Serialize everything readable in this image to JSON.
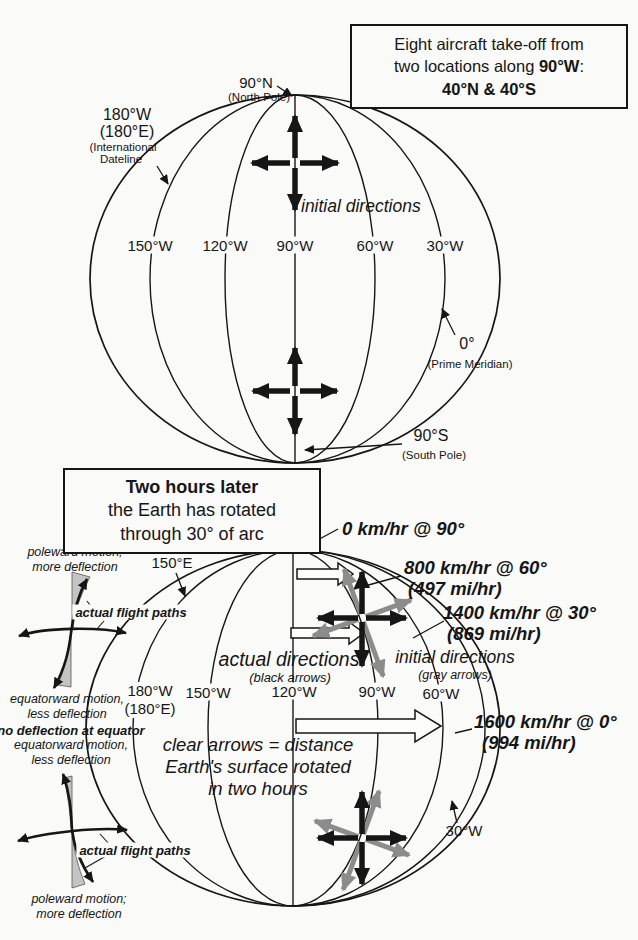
{
  "top": {
    "box": {
      "l1": "Eight aircraft take-off from",
      "l2a": "two locations along ",
      "l2b": "90°W",
      "l2c": ":",
      "l3": "40°N & 40°S"
    },
    "north_pole": {
      "deg": "90°N",
      "name": "(North Pole)"
    },
    "dateline": {
      "deg": "180°W",
      "deg2": "(180°E)",
      "name1": "(International",
      "name2": "Dateline"
    },
    "prime": {
      "deg": "0°",
      "name": "(Prime Meridian)"
    },
    "south_pole": {
      "deg": "90°S",
      "name": "(South Pole)"
    },
    "initial_directions": "initial directions",
    "meridians": {
      "m150w": "150°W",
      "m120w": "120°W",
      "m90w": "90°W",
      "m60w": "60°W",
      "m30w": "30°W"
    }
  },
  "bottom": {
    "box": {
      "l1": "Two hours later",
      "l2": "the Earth has rotated",
      "l3": "through 30° of arc"
    },
    "speed0": "0 km/hr @ 90°",
    "speed800": "800 km/hr @ 60°",
    "speed800b": "(497 mi/hr)",
    "speed1400": "1400 km/hr @ 30°",
    "speed1400b": "(869 mi/hr)",
    "speed1600": "1600 km/hr @ 0°",
    "speed1600b": "(994 mi/hr)",
    "actual": "actual directions",
    "actual_sub": "(black arrows)",
    "initial": "initial directions",
    "initial_sub": "(gray arrows)",
    "clear1": "clear arrows = distance",
    "clear2": "Earth's surface rotated",
    "clear3": "in two hours",
    "meridians": {
      "e150": "150°E",
      "w180": "180°W",
      "w180b": "(180°E)",
      "w150": "150°W",
      "w120": "120°W",
      "w90": "90°W",
      "w60": "60°W",
      "w30": "30°W"
    }
  },
  "side": {
    "top_pole1": "poleward motion;",
    "top_pole2": "more deflection",
    "top_paths": "actual flight paths",
    "top_eq1": "equatorward motion,",
    "top_eq2": "less deflection",
    "no_defl": "no deflection at equator",
    "bot_eq1": "equatorward motion,",
    "bot_eq2": "less deflection",
    "bot_paths": "actual flight paths",
    "bot_pole1": "poleward motion;",
    "bot_pole2": "more deflection"
  },
  "colors": {
    "ink": "#161616",
    "gray_arrow": "#8c8c8c",
    "wedge": "#c4c4c4",
    "paper": "#fafaf8"
  }
}
